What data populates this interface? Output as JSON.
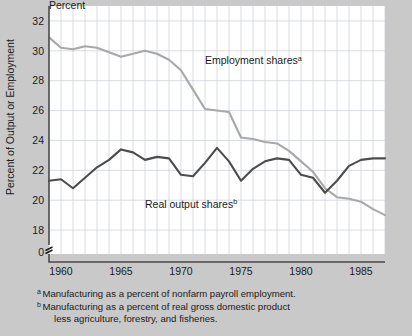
{
  "chart_data": {
    "type": "line",
    "title": "Percent",
    "ylabel": "Percent of Output or Employment",
    "xlabel": "",
    "xlim": [
      1959,
      1987
    ],
    "ylim": [
      17.0,
      33.0
    ],
    "grid": true,
    "legend_position": "inline-annotation",
    "yticks": [
      18,
      20,
      22,
      24,
      26,
      28,
      30,
      32
    ],
    "ytick_labels": [
      "18",
      "20",
      "22",
      "24",
      "26",
      "28",
      "30",
      "32"
    ],
    "y_axis_break_label": "0",
    "xticks": [
      1960,
      1965,
      1970,
      1975,
      1980,
      1985
    ],
    "xtick_labels": [
      "1960",
      "1965",
      "1970",
      "1975",
      "1980",
      "1985"
    ],
    "x": [
      1959,
      1960,
      1961,
      1962,
      1963,
      1964,
      1965,
      1966,
      1967,
      1968,
      1969,
      1970,
      1971,
      1972,
      1973,
      1974,
      1975,
      1976,
      1977,
      1978,
      1979,
      1980,
      1981,
      1982,
      1983,
      1984,
      1985,
      1986,
      1987
    ],
    "series": [
      {
        "name": "Employment shares",
        "footnote_marker": "a",
        "color": "#a8a8a8",
        "values": [
          30.9,
          30.2,
          30.1,
          30.3,
          30.2,
          29.9,
          29.6,
          29.8,
          30.0,
          29.8,
          29.4,
          28.7,
          27.4,
          26.1,
          26.0,
          25.9,
          24.2,
          24.1,
          23.9,
          23.8,
          23.3,
          22.6,
          21.9,
          20.8,
          20.2,
          20.1,
          19.9,
          19.4,
          19.0
        ]
      },
      {
        "name": "Real output shares",
        "footnote_marker": "b",
        "color": "#4c4c4c",
        "values": [
          21.3,
          21.4,
          20.8,
          21.5,
          22.2,
          22.7,
          23.4,
          23.2,
          22.7,
          22.9,
          22.8,
          21.7,
          21.6,
          22.5,
          23.5,
          22.6,
          21.3,
          22.1,
          22.6,
          22.8,
          22.7,
          21.7,
          21.5,
          20.5,
          21.3,
          22.3,
          22.7,
          22.8,
          22.8
        ]
      }
    ],
    "annotations": [
      {
        "text": "Employment shares",
        "marker": "a",
        "x": 1972.0,
        "y": 29.1
      },
      {
        "text": "Real output shares",
        "marker": "b",
        "x": 1967.0,
        "y": 19.5
      }
    ]
  },
  "footnotes": [
    {
      "marker": "a",
      "text": "Manufacturing as a percent of nonfarm payroll employment."
    },
    {
      "marker": "b",
      "text": "Manufacturing as a percent of real gross domestic product",
      "continuation": "less agriculture, forestry, and fisheries."
    }
  ],
  "colors": {
    "background": "#c9c9c9",
    "plot_area": "#ffffff",
    "grid": "#c8cdd6",
    "axis": "#4a4a4a",
    "employment_line": "#a8a8a8",
    "output_line": "#4c4c4c"
  }
}
